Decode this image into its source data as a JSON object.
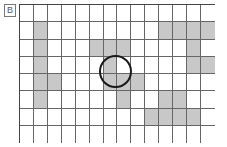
{
  "label": "B",
  "grid": {
    "columns": 14,
    "rows": 8,
    "shaded_color": "#c8c8c8",
    "line_color": "#666666",
    "shaded_cells": {
      "0": [],
      "1": [
        1,
        10,
        11,
        12,
        13
      ],
      "2": [
        1,
        5,
        6,
        7,
        12
      ],
      "3": [
        1,
        6,
        12,
        13
      ],
      "4": [
        1,
        2,
        6,
        7,
        8
      ],
      "5": [
        1,
        7,
        10,
        11
      ],
      "6": [
        9,
        10,
        11,
        12
      ],
      "7": []
    }
  },
  "circle": {
    "center_row_between": [
      3,
      4
    ],
    "center_col_between": [
      6,
      7
    ],
    "stroke_color": "#1a1a1a"
  }
}
